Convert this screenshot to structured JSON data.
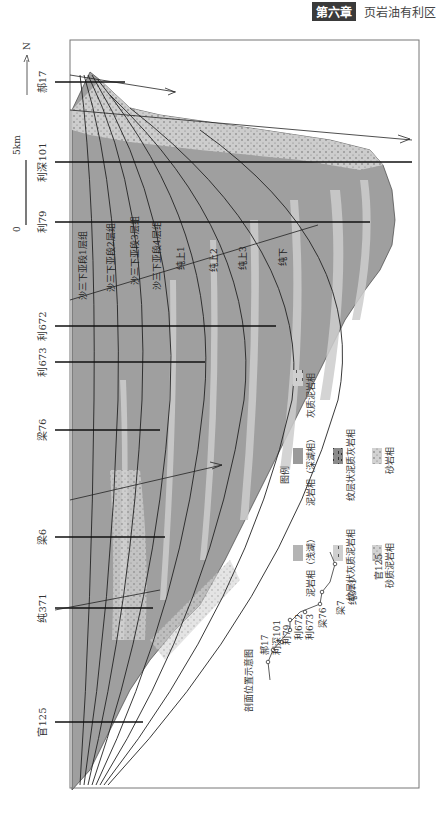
{
  "header": {
    "chapter": "第六章",
    "title": "页岩油有利区"
  },
  "figure": {
    "orientation": "rotated-90",
    "north_label": "N",
    "scale": {
      "zero": "0",
      "length": "5km"
    },
    "wells": [
      {
        "name": "郝17",
        "y": 82
      },
      {
        "name": "利深101",
        "y": 162
      },
      {
        "name": "利79",
        "y": 222
      },
      {
        "name": "利672",
        "y": 326
      },
      {
        "name": "利673",
        "y": 362
      },
      {
        "name": "梁76",
        "y": 430
      },
      {
        "name": "梁6",
        "y": 537
      },
      {
        "name": "纯371",
        "y": 608
      },
      {
        "name": "官125",
        "y": 722
      }
    ],
    "layers": [
      "沙三下亚段1层组",
      "沙三下亚段2层组",
      "沙三下亚段3层组",
      "沙三下亚段4层组",
      "纯上1",
      "纯上2",
      "纯上3",
      "纯下"
    ],
    "legend": {
      "title": "图例",
      "items": [
        {
          "label": "泥岩相（深湖相）",
          "color": "#9a9a9a",
          "pattern": "solid"
        },
        {
          "label": "泥岩相（浅湖）",
          "color": "#b4b4b4",
          "pattern": "solid"
        },
        {
          "label": "灰质泥岩相",
          "color": "#cfcfcf",
          "pattern": "dash"
        },
        {
          "label": "纹层状泥质灰岩相",
          "color": "#8a8a8a",
          "pattern": "layered"
        },
        {
          "label": "纹层状灰质泥岩相",
          "color": "#d8d8d8",
          "pattern": "layered"
        },
        {
          "label": "砂岩相",
          "color": "#dedede",
          "pattern": "dots"
        },
        {
          "label": "砂质泥岩相",
          "color": "#b0b0b0",
          "pattern": "dots"
        }
      ]
    },
    "inset": {
      "title": "剖面位置示意图",
      "wells": [
        "郝17",
        "利深101",
        "利79",
        "利672",
        "利673",
        "梁76",
        "梁7",
        "纯371",
        "官125"
      ]
    }
  }
}
